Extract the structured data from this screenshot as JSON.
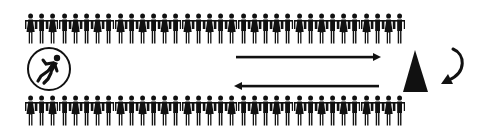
{
  "diagram": {
    "colors": {
      "ink": "#111111",
      "background": "#ffffff"
    },
    "top_row": {
      "count": 34,
      "pattern": [
        "woman",
        "man"
      ]
    },
    "bottom_row": {
      "count": 34,
      "pattern": [
        "woman",
        "man"
      ]
    },
    "circle_icon": "running-person-icon",
    "arrows": [
      {
        "name": "forward-arrow",
        "direction": "right"
      },
      {
        "name": "return-arrow",
        "direction": "left"
      }
    ],
    "turn_marker": "cone-icon",
    "turn_arrow": "u-turn-arrow-icon"
  }
}
